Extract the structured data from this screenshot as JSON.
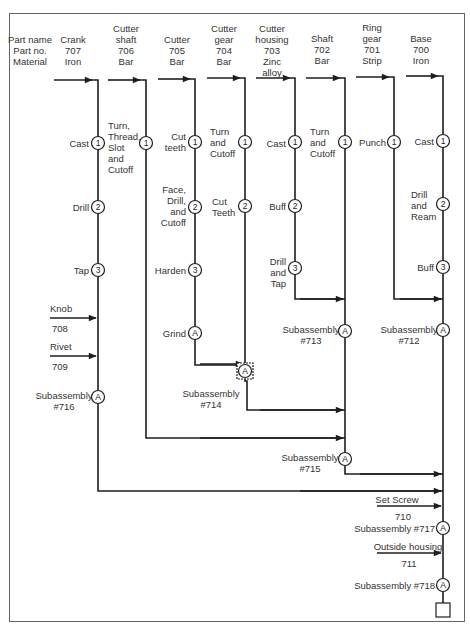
{
  "header": {
    "row_labels": [
      "Part name",
      "Part no.",
      "Material"
    ]
  },
  "columns": [
    {
      "name": "Crank",
      "part_no": "707",
      "material": "Iron",
      "header": "Crank\n707\nIron"
    },
    {
      "name": "Cutter shaft",
      "part_no": "706",
      "material": "Bar",
      "header": "Cutter\nshaft\n706\nBar"
    },
    {
      "name": "Cutter",
      "part_no": "705",
      "material": "Bar",
      "header": "Cutter\n705\nBar"
    },
    {
      "name": "Cutter gear",
      "part_no": "704",
      "material": "Bar",
      "header": "Cutter\ngear\n704\nBar"
    },
    {
      "name": "Cutter housing",
      "part_no": "703",
      "material": "Zinc alloy",
      "header": "Cutter\nhousing\n703\nZinc\nalloy"
    },
    {
      "name": "Shaft",
      "part_no": "702",
      "material": "Bar",
      "header": "Shaft\n702\nBar"
    },
    {
      "name": "Ring gear",
      "part_no": "701",
      "material": "Strip",
      "header": "Ring\ngear\n701\nStrip"
    },
    {
      "name": "Base",
      "part_no": "700",
      "material": "Iron",
      "header": "Base\n700\nIron"
    }
  ],
  "operations": {
    "crank": [
      {
        "symbol": "1",
        "label": "Cast"
      },
      {
        "symbol": "2",
        "label": "Drill"
      },
      {
        "symbol": "3",
        "label": "Tap"
      }
    ],
    "cutter_shaft": [
      {
        "symbol": "1",
        "label": "Turn,\nThread,\nSlot\nand\nCutoff"
      }
    ],
    "cutter": [
      {
        "symbol": "1",
        "label": "Cut\nteeth"
      },
      {
        "symbol": "2",
        "label": "Face,\nDrill,\nand\nCutoff"
      },
      {
        "symbol": "3",
        "label": "Harden"
      },
      {
        "symbol": "A",
        "label": "Grind"
      }
    ],
    "cutter_gear": [
      {
        "symbol": "1",
        "label": "Turn\nand\nCutoff"
      },
      {
        "symbol": "2",
        "label": "Cut\nTeeth"
      }
    ],
    "cutter_housing": [
      {
        "symbol": "1",
        "label": "Cast"
      },
      {
        "symbol": "2",
        "label": "Buff"
      },
      {
        "symbol": "3",
        "label": "Drill\nand\nTap"
      }
    ],
    "shaft": [
      {
        "symbol": "1",
        "label": "Turn\nand\nCutoff"
      }
    ],
    "ring_gear": [
      {
        "symbol": "1",
        "label": "Punch"
      }
    ],
    "base": [
      {
        "symbol": "1",
        "label": "Cast"
      },
      {
        "symbol": "2",
        "label": "Drill\nand\nReam"
      },
      {
        "symbol": "3",
        "label": "Buff"
      }
    ]
  },
  "purchased_parts": [
    {
      "name": "Knob",
      "part_no": "708"
    },
    {
      "name": "Rivet",
      "part_no": "709"
    },
    {
      "name": "Set Screw",
      "part_no": "710"
    },
    {
      "name": "Outside housing",
      "part_no": "711"
    }
  ],
  "subassemblies": [
    {
      "symbol": "A",
      "label": "Subassembly\n#716"
    },
    {
      "symbol": "A",
      "label": "Subassembly\n#714"
    },
    {
      "symbol": "A",
      "label": "Subassembly\n#713"
    },
    {
      "symbol": "A",
      "label": "Subassembly\n#712"
    },
    {
      "symbol": "A",
      "label": "Subassembly\n#715"
    },
    {
      "symbol": "A",
      "label": "Subassembly #717"
    },
    {
      "symbol": "A",
      "label": "Subassembly #718"
    }
  ],
  "colors": {
    "line": "#1e1e1e",
    "text": "#333333",
    "border": "#666666"
  }
}
